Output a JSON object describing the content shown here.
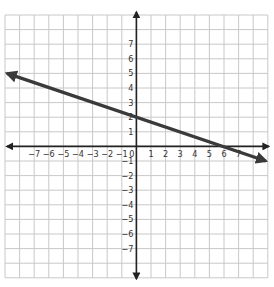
{
  "chart_data": {
    "type": "line",
    "title": "",
    "xlabel": "",
    "ylabel": "",
    "xlim": [
      -9,
      9
    ],
    "ylim": [
      -9,
      9
    ],
    "grid": true,
    "x_tick_labels": [
      "−7",
      "−6",
      "−5",
      "−4",
      "−3",
      "−2",
      "−1",
      "0",
      "1",
      "2",
      "3",
      "4",
      "5",
      "6",
      "7"
    ],
    "y_tick_labels": [
      "7",
      "6",
      "5",
      "4",
      "3",
      "2",
      "1",
      "−1",
      "−2",
      "−3",
      "−4",
      "−5",
      "−6",
      "−7"
    ],
    "x_ticks": [
      -7,
      -6,
      -5,
      -4,
      -3,
      -2,
      -1,
      0,
      1,
      2,
      3,
      4,
      5,
      6,
      7
    ],
    "y_ticks": [
      7,
      6,
      5,
      4,
      3,
      2,
      1,
      -1,
      -2,
      -3,
      -4,
      -5,
      -6,
      -7
    ],
    "series": [
      {
        "name": "line",
        "equation": "y = -x/3 + 2",
        "slope": -0.3333,
        "intercept": 2,
        "x": [
          -9,
          0,
          6,
          9
        ],
        "y": [
          5,
          2,
          0,
          -1
        ],
        "arrows": "both",
        "color": "#3a3a3a"
      }
    ],
    "colors": {
      "grid": "#c8c8c8",
      "axes": "#222222",
      "line": "#3a3a3a"
    }
  }
}
